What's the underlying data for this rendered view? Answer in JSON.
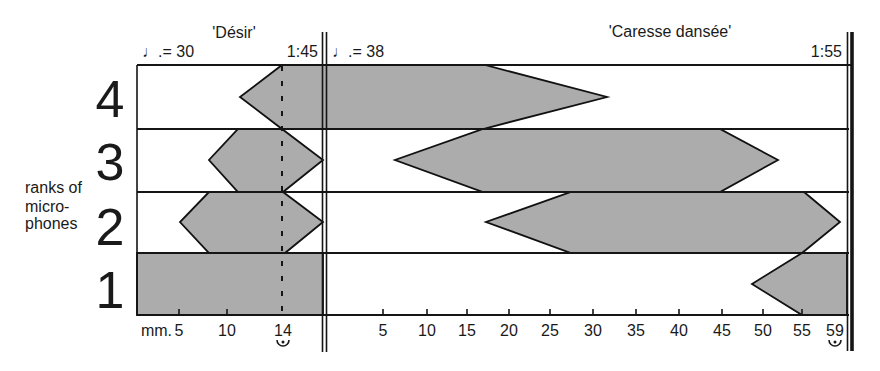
{
  "chart_data": {
    "type": "area",
    "title": "",
    "xlabel": "mm.",
    "ylabel": "ranks of microphones",
    "ylabel_lines": [
      "ranks of",
      "micro-",
      "phones"
    ],
    "y_categories": [
      "1",
      "2",
      "3",
      "4"
    ],
    "grid": false,
    "legend": null,
    "fill_color": "#acacac",
    "line_color": "#111111",
    "sections": [
      {
        "name": "'Désir'",
        "tempo": "♩.= 30",
        "duration": "1:45",
        "ticks": [
          {
            "label": "5",
            "prefix": "mm.",
            "measure": 5,
            "x": 179,
            "tick": true
          },
          {
            "label": "10",
            "measure": 10,
            "x": 227,
            "tick": true
          },
          {
            "label": "14",
            "measure": 14,
            "x": 283,
            "tick": false,
            "fermata": true
          }
        ],
        "rank_envelopes": [
          {
            "rank": 4,
            "fade_in_from": 11,
            "full_from": 14,
            "full_to": "section end",
            "fade_out_to": null
          },
          {
            "rank": 3,
            "fade_in_from": 8,
            "full_from": 11,
            "full_to": 14,
            "fade_out_to": 17
          },
          {
            "rank": 2,
            "fade_in_from": 5,
            "full_from": 8,
            "full_to": 14,
            "fade_out_to": 17
          },
          {
            "rank": 1,
            "fade_in_from": null,
            "full_from": 1,
            "full_to": 17,
            "fade_out_to": null
          }
        ]
      },
      {
        "name": "'Caresse dansée'",
        "tempo": "♩.= 38",
        "duration": "1:55",
        "ticks": [
          {
            "label": "5",
            "measure": 5,
            "x": 383,
            "tick": true
          },
          {
            "label": "10",
            "measure": 10,
            "x": 427,
            "tick": true
          },
          {
            "label": "15",
            "measure": 15,
            "x": 467,
            "tick": true
          },
          {
            "label": "20",
            "measure": 20,
            "x": 509,
            "tick": true
          },
          {
            "label": "25",
            "measure": 25,
            "x": 550,
            "tick": true
          },
          {
            "label": "30",
            "measure": 30,
            "x": 593,
            "tick": true
          },
          {
            "label": "35",
            "measure": 35,
            "x": 636,
            "tick": true
          },
          {
            "label": "40",
            "measure": 40,
            "x": 679,
            "tick": true
          },
          {
            "label": "45",
            "measure": 45,
            "x": 722,
            "tick": true
          },
          {
            "label": "50",
            "measure": 50,
            "x": 763,
            "tick": true
          },
          {
            "label": "55",
            "measure": 55,
            "x": 802,
            "tick": true
          },
          {
            "label": "59",
            "measure": 59,
            "x": 835,
            "tick": false,
            "fermata": true
          }
        ],
        "rank_envelopes": [
          {
            "rank": 4,
            "fade_in_from": null,
            "full_from": 1,
            "full_to": 17,
            "fade_out_to": 32
          },
          {
            "rank": 3,
            "fade_in_from": 6,
            "full_from": 17,
            "full_to": 45,
            "fade_out_to": 52
          },
          {
            "rank": 2,
            "fade_in_from": 17,
            "full_from": 27,
            "full_to": 55,
            "fade_out_to": 59
          },
          {
            "rank": 1,
            "fade_in_from": 49,
            "full_from": 55,
            "full_to": 59,
            "fade_out_to": null
          }
        ]
      }
    ],
    "shapes": [
      {
        "rank": 4,
        "section": "desir-caresse",
        "points": [
          [
            282,
            65
          ],
          [
            485,
            65
          ],
          [
            607,
            97
          ],
          [
            483,
            129
          ],
          [
            282,
            129
          ],
          [
            240,
            97
          ]
        ]
      },
      {
        "rank": 3,
        "section": "desir",
        "points": [
          [
            238,
            129
          ],
          [
            282,
            129
          ],
          [
            323,
            160
          ],
          [
            283,
            192
          ],
          [
            238,
            192
          ],
          [
            209,
            160
          ]
        ]
      },
      {
        "rank": 2,
        "section": "desir",
        "points": [
          [
            209,
            192
          ],
          [
            283,
            192
          ],
          [
            323,
            222
          ],
          [
            285,
            253
          ],
          [
            209,
            253
          ],
          [
            180,
            222
          ]
        ]
      },
      {
        "rank": 1,
        "section": "desir",
        "points": [
          [
            137,
            253
          ],
          [
            323,
            253
          ],
          [
            323,
            315
          ],
          [
            137,
            315
          ]
        ]
      },
      {
        "rank": 3,
        "section": "caresse",
        "points": [
          [
            483,
            129
          ],
          [
            720,
            129
          ],
          [
            778,
            160
          ],
          [
            720,
            192
          ],
          [
            483,
            192
          ],
          [
            395,
            160
          ]
        ]
      },
      {
        "rank": 2,
        "section": "caresse",
        "points": [
          [
            571,
            192
          ],
          [
            804,
            192
          ],
          [
            840,
            222
          ],
          [
            802,
            253
          ],
          [
            571,
            253
          ],
          [
            486,
            222
          ]
        ]
      },
      {
        "rank": 1,
        "section": "caresse",
        "points": [
          [
            802,
            253
          ],
          [
            847,
            253
          ],
          [
            847,
            315
          ],
          [
            802,
            315
          ],
          [
            752,
            284
          ]
        ]
      }
    ]
  }
}
